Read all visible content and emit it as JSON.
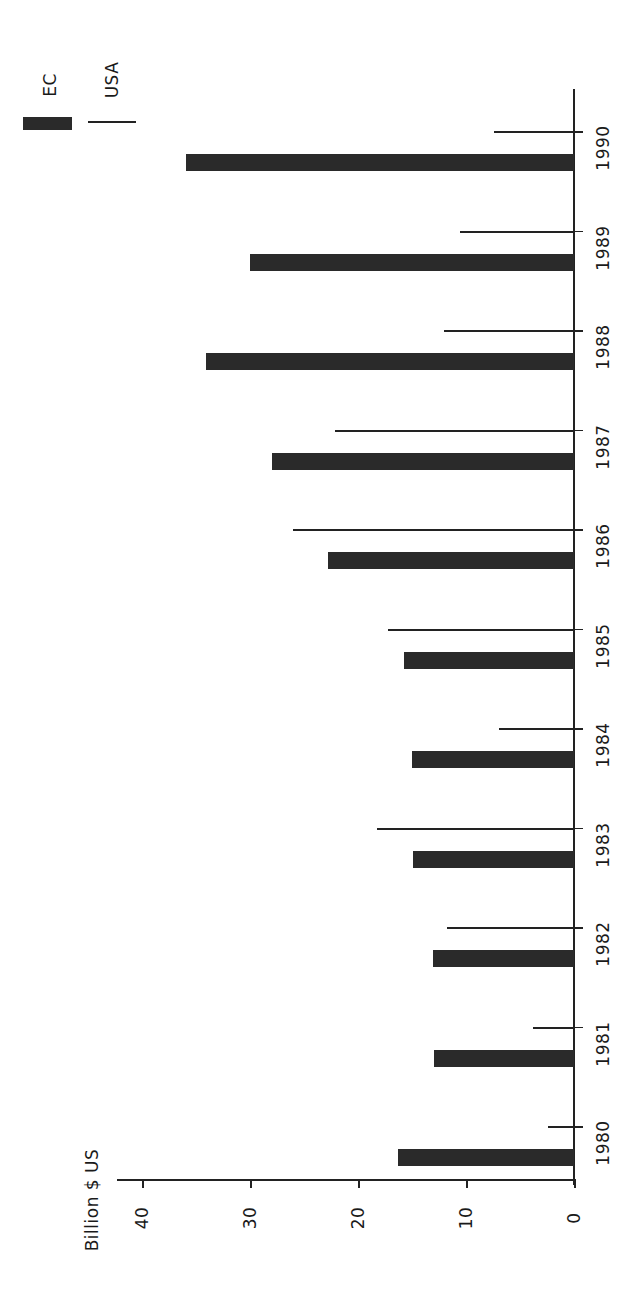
{
  "chart_data": {
    "type": "bar",
    "orientation": "horizontal",
    "title": "",
    "xlabel": "",
    "ylabel": "Billion $ US",
    "categories": [
      "1980",
      "1981",
      "1982",
      "1983",
      "1984",
      "1985",
      "1986",
      "1987",
      "1988",
      "1989",
      "1990"
    ],
    "series": [
      {
        "name": "EC",
        "style": "thick bar",
        "color": "#2a2a2a",
        "values": [
          16.3,
          13.0,
          13.1,
          14.9,
          15.0,
          15.7,
          22.8,
          28.0,
          34.1,
          30.0,
          35.9
        ]
      },
      {
        "name": "USA",
        "style": "thin line",
        "color": "#222222",
        "values": [
          2.4,
          3.8,
          11.8,
          18.2,
          6.9,
          17.2,
          26.0,
          22.1,
          12.0,
          10.6,
          7.4
        ]
      }
    ],
    "value_ticks": [
      0,
      10,
      20,
      30,
      40
    ],
    "ylim": [
      0,
      42
    ],
    "grid": false,
    "legend_position": "top-left"
  },
  "axis": {
    "unit_label": "Billion $ US",
    "tick_labels": [
      "0",
      "10",
      "20",
      "30",
      "40"
    ]
  },
  "legend": {
    "ec_label": "EC",
    "usa_label": "USA"
  }
}
